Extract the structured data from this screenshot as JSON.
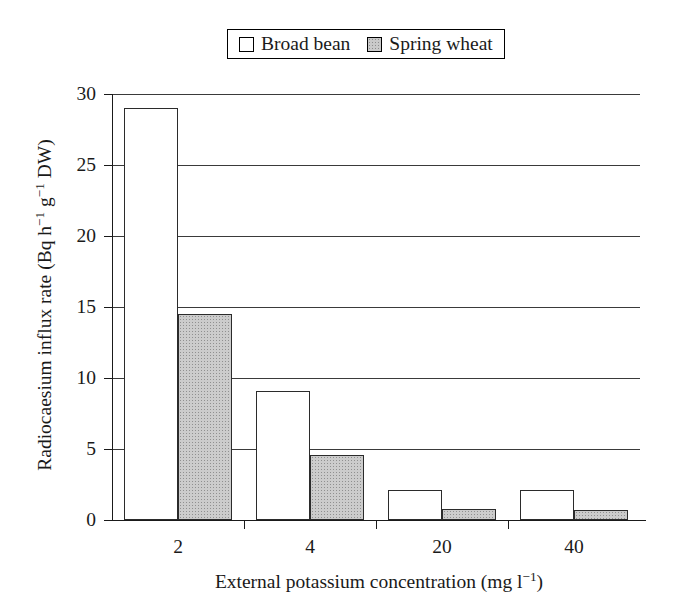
{
  "chart_data": {
    "type": "bar",
    "title": "",
    "xlabel": "External potassium concentration (mg l−1)",
    "xlabel_parts": {
      "text": "External potassium concentration (mg l",
      "sup": "−1",
      "tail": ")"
    },
    "ylabel": "Radiocaesium influx rate (Bq h−1 g−1 DW)",
    "ylabel_parts": {
      "a": "Radiocaesium influx rate (Bq h",
      "sup1": "−1",
      "b": " g",
      "sup2": "−1",
      "c": " DW)"
    },
    "categories": [
      "2",
      "4",
      "20",
      "40"
    ],
    "series": [
      {
        "name": "Broad bean",
        "values": [
          29.0,
          9.1,
          2.1,
          2.1
        ],
        "fill": "#ffffff",
        "edge": "#2b2b2b"
      },
      {
        "name": "Spring wheat",
        "values": [
          14.5,
          4.6,
          0.75,
          0.7
        ],
        "fill": "#cccccc",
        "edge": "#2b2b2b"
      }
    ],
    "ylim": [
      0,
      30
    ],
    "yticks": [
      0,
      5,
      10,
      15,
      20,
      25,
      30
    ],
    "ytick_labels": [
      "0",
      "5",
      "10",
      "15",
      "20",
      "25",
      "30"
    ],
    "grid": true,
    "grid_axis": "y",
    "legend_position": "top-center",
    "legend_entries": [
      "Broad bean",
      "Spring wheat"
    ]
  },
  "legend": {
    "entries": [
      {
        "label": "Broad bean",
        "swatch": "unfilled-square-swatch"
      },
      {
        "label": "Spring wheat",
        "swatch": "stippled-square-swatch"
      }
    ]
  },
  "axes": {
    "y_title": "Radiocaesium influx rate (Bq h−1 g−1 DW)",
    "x_title": "External potassium concentration (mg l−1)",
    "y_tick_labels": [
      "30",
      "25",
      "20",
      "15",
      "10",
      "5",
      "0"
    ],
    "x_tick_labels": [
      "2",
      "4",
      "20",
      "40"
    ]
  }
}
